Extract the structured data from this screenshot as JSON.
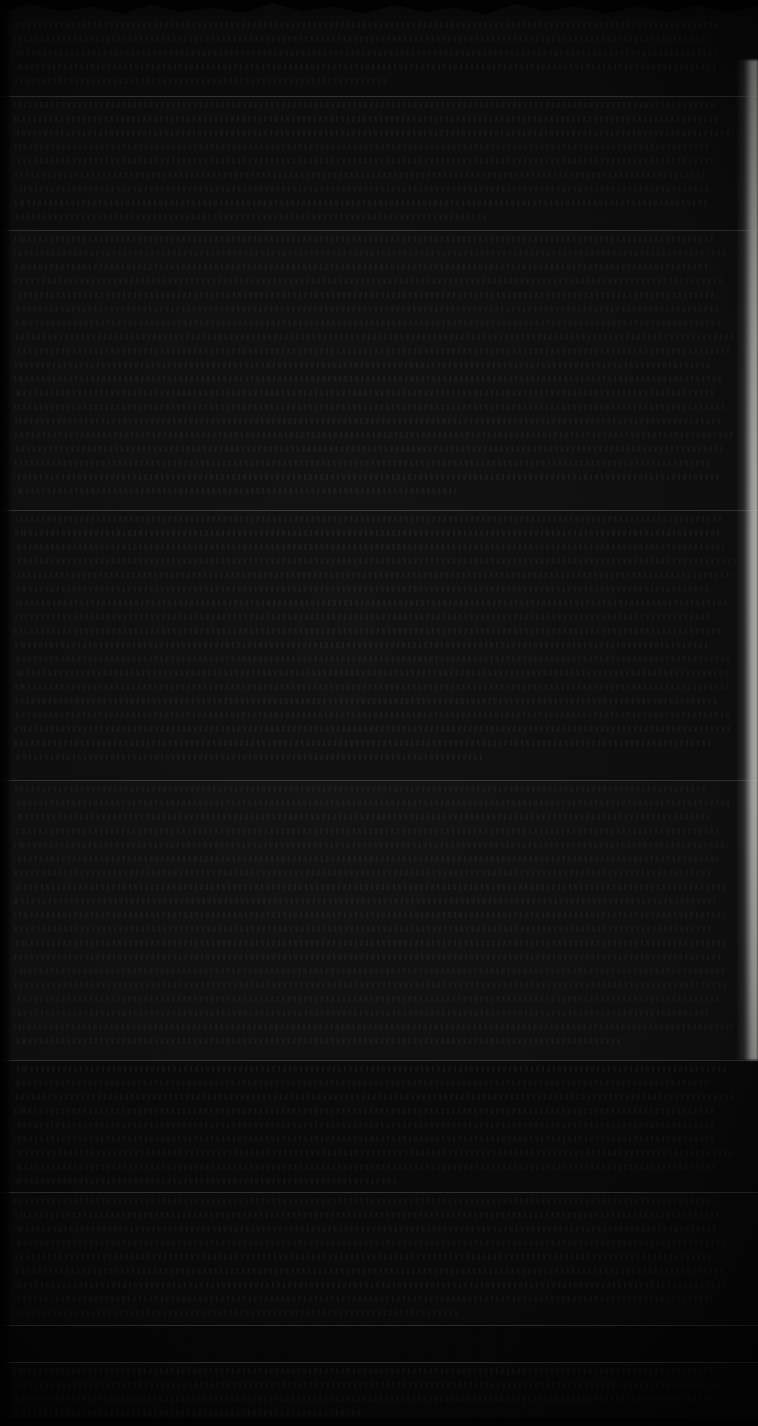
{
  "page": {
    "kind": "scanned-document-page",
    "width": 758,
    "height": 1426,
    "legible_text": "",
    "note": "Severely underexposed scan; no characters, labels, numbers or UI text are legible at any zoom level.",
    "background_color": "#0a0a0a",
    "column": {
      "text_left": 14,
      "text_right": 736,
      "line_pitch_px": 14
    }
  },
  "edges": {
    "top_artifact": {
      "name": "wavy-torn-top-edge",
      "height": 16,
      "color": "#000000"
    },
    "left_artifact": {
      "name": "dark-left-margin",
      "width": 12,
      "color": "#000000"
    },
    "bottom_artifact": {
      "name": "dark-bottom-margin",
      "height": 8,
      "color": "#000000"
    },
    "right_artifact": {
      "name": "bright-torn-right-edge",
      "top": 60,
      "height": 1000,
      "width": 22,
      "color": "#fcfcfa"
    }
  },
  "rules": [
    {
      "y": 96,
      "width": 758,
      "color": "#bebebe"
    },
    {
      "y": 230,
      "width": 758,
      "color": "#bebebe"
    },
    {
      "y": 510,
      "width": 758,
      "color": "#bebebe"
    },
    {
      "y": 780,
      "width": 758,
      "color": "#bebebe"
    },
    {
      "y": 1060,
      "width": 758,
      "color": "#bebebe"
    },
    {
      "y": 1192,
      "width": 758,
      "color": "#bebebe"
    },
    {
      "y": 1325,
      "width": 758,
      "color": "#bebebe"
    },
    {
      "y": 1362,
      "width": 758,
      "color": "#bebebe"
    }
  ],
  "bands": [
    {
      "name": "band-header",
      "top": 16,
      "height": 80,
      "tone": "#0d0d0d"
    },
    {
      "name": "band-upper-body",
      "top": 97,
      "height": 133,
      "tone": "#101010"
    },
    {
      "name": "band-body-1",
      "top": 231,
      "height": 279,
      "tone": "#121212"
    },
    {
      "name": "band-body-2",
      "top": 511,
      "height": 269,
      "tone": "#111111"
    },
    {
      "name": "band-body-3",
      "top": 781,
      "height": 279,
      "tone": "#131313"
    },
    {
      "name": "band-lower-1",
      "top": 1061,
      "height": 131,
      "tone": "#0b0b0b"
    },
    {
      "name": "band-lower-2",
      "top": 1193,
      "height": 132,
      "tone": "#0c0c0c"
    },
    {
      "name": "band-footer-dark",
      "top": 1326,
      "height": 36,
      "tone": "#070707"
    },
    {
      "name": "band-footer-bottom",
      "top": 1363,
      "height": 63,
      "tone": "#090909"
    }
  ],
  "text_blocks": [
    {
      "name": "text-block-header",
      "top": 22,
      "left": 14,
      "width": 722,
      "lines": 5
    },
    {
      "name": "text-block-upper-body",
      "top": 102,
      "left": 14,
      "width": 722,
      "lines": 9
    },
    {
      "name": "text-block-body-1",
      "top": 236,
      "left": 14,
      "width": 722,
      "lines": 19
    },
    {
      "name": "text-block-body-2",
      "top": 516,
      "left": 14,
      "width": 722,
      "lines": 18
    },
    {
      "name": "text-block-body-3",
      "top": 786,
      "left": 14,
      "width": 722,
      "lines": 19
    },
    {
      "name": "text-block-lower-1",
      "top": 1066,
      "left": 14,
      "width": 722,
      "lines": 9
    },
    {
      "name": "text-block-lower-2",
      "top": 1198,
      "left": 14,
      "width": 722,
      "lines": 9
    },
    {
      "name": "text-block-footer",
      "top": 1368,
      "left": 14,
      "width": 722,
      "lines": 4
    }
  ]
}
